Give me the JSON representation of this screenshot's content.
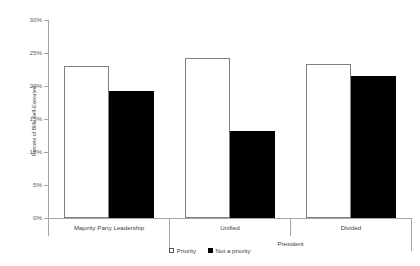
{
  "chart_data": {
    "type": "bar",
    "title": "",
    "xlabel": "President",
    "ylabel": "Percent of Bills Self-Executed",
    "categories": [
      "Majority Party Leadership",
      "Unified",
      "Divided"
    ],
    "series": [
      {
        "name": "Priority",
        "color": "#ffffff",
        "values": [
          23.0,
          24.2,
          23.4
        ]
      },
      {
        "name": "Not a priority",
        "color": "#000000",
        "values": [
          19.2,
          13.2,
          21.5
        ]
      }
    ],
    "ylim": [
      0,
      30
    ],
    "ytick_values": [
      30,
      25,
      20,
      15,
      10,
      5,
      0
    ],
    "ytick_labels": [
      "30%",
      "25%",
      "20%",
      "15%",
      "10%",
      "5%",
      "0%"
    ],
    "grid": false,
    "legend_position": "bottom-center",
    "legend_entries": [
      "Priority",
      "Not a priority"
    ],
    "group_bracket_label": "President",
    "group_bracket_covers": [
      "Unified",
      "Divided"
    ]
  }
}
